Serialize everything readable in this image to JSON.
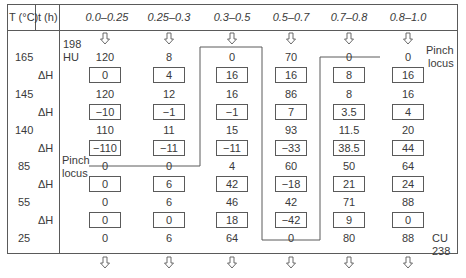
{
  "header": {
    "temperature_label": "T (°C)",
    "time_label": "t (h)",
    "intervals": [
      "0.0–0.25",
      "0.25–0.3",
      "0.3–0.5",
      "0.5–0.7",
      "0.7–0.8",
      "0.8–1.0"
    ]
  },
  "temperatures": [
    "165",
    "145",
    "140",
    "85",
    "55",
    "25"
  ],
  "delta_h_label": "ΔH",
  "hot_utility": {
    "label_line1": "198",
    "label_line2": "HU"
  },
  "cold_utility": {
    "label_line1": "CU",
    "label_line2": "238"
  },
  "pinch_labels": {
    "right_line1": "Pinch",
    "right_line2": "locus",
    "left_line1": "Pinch",
    "left_line2": "locus"
  },
  "columns": [
    {
      "interval": "0.0–0.25",
      "cascade": [
        "120",
        "120",
        "110",
        "0",
        "0",
        "0"
      ],
      "delta_h": [
        "0",
        "−10",
        "−110",
        "0",
        "0"
      ]
    },
    {
      "interval": "0.25–0.3",
      "cascade": [
        "8",
        "12",
        "11",
        "0",
        "6",
        "6"
      ],
      "delta_h": [
        "4",
        "−1",
        "−11",
        "6",
        "0"
      ]
    },
    {
      "interval": "0.3–0.5",
      "cascade": [
        "0",
        "16",
        "15",
        "4",
        "46",
        "64"
      ],
      "delta_h": [
        "16",
        "−1",
        "−11",
        "42",
        "18"
      ]
    },
    {
      "interval": "0.5–0.7",
      "cascade": [
        "70",
        "86",
        "93",
        "60",
        "42",
        "0"
      ],
      "delta_h": [
        "16",
        "7",
        "−33",
        "−18",
        "−42"
      ]
    },
    {
      "interval": "0.7–0.8",
      "cascade": [
        "0",
        "8",
        "11.5",
        "50",
        "71",
        "80"
      ],
      "delta_h": [
        "8",
        "3.5",
        "38.5",
        "21",
        "9"
      ]
    },
    {
      "interval": "0.8–1.0",
      "cascade": [
        "0",
        "16",
        "20",
        "64",
        "88",
        "88"
      ],
      "delta_h": [
        "16",
        "4",
        "44",
        "24",
        "0"
      ]
    }
  ],
  "colors": {
    "line": "#5a5a5a",
    "text": "#3a3a3a",
    "background": "#ffffff"
  }
}
